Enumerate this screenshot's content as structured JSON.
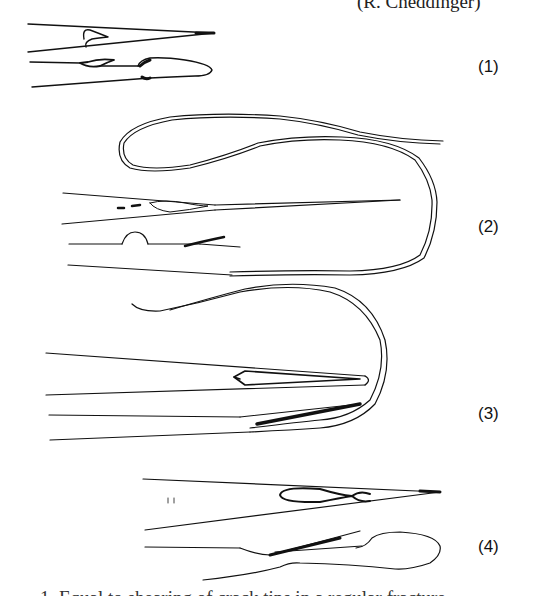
{
  "figure": {
    "credit_partial": "(R. Cheddinger)",
    "caption_partial": "1. Equal to shearing of crack tips in a regular fracture",
    "panels": [
      {
        "label": "(1)"
      },
      {
        "label": "(2)"
      },
      {
        "label": "(3)"
      },
      {
        "label": "(4)"
      }
    ],
    "line_color": "#111111",
    "background": "#ffffff"
  }
}
